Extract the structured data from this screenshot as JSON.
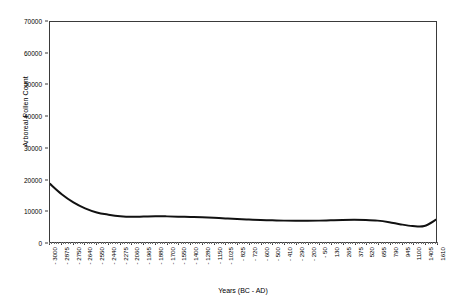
{
  "chart_data": {
    "type": "line",
    "title": "",
    "xlabel": "Years (BC - AD)",
    "ylabel": "Arboreal Pollen Count",
    "ylim": [
      0,
      70000
    ],
    "yticks": [
      0,
      10000,
      20000,
      30000,
      40000,
      50000,
      60000,
      70000
    ],
    "ytick_labels": [
      "0",
      "10000",
      "20000",
      "30000",
      "40000",
      "50000",
      "60000",
      "70000"
    ],
    "grid": false,
    "legend": "none",
    "categories": [
      "- 3000",
      "- 2875",
      "- 2750",
      "- 2640",
      "- 2550",
      "- 2440",
      "- 2275",
      "- 2060",
      "- 1965",
      "- 1880",
      "- 1700",
      "- 1550",
      "- 1400",
      "- 1280",
      "- 1150",
      "- 1025",
      "- 825",
      "- 720",
      "- 600",
      "- 500",
      "- 410",
      "- 290",
      "- 200",
      "- 50",
      "130",
      "265",
      "375",
      "520",
      "655",
      "790",
      "945",
      "1100",
      "1405",
      "1610"
    ],
    "values": [
      18500,
      15200,
      12600,
      10700,
      9400,
      8700,
      8200,
      8000,
      8100,
      8200,
      8150,
      8050,
      7950,
      7850,
      7700,
      7500,
      7300,
      7150,
      7000,
      6900,
      6800,
      6750,
      6750,
      6800,
      6900,
      7000,
      7050,
      7000,
      6800,
      6300,
      5600,
      5100,
      5100,
      7100
    ],
    "series_name": "Arboreal Pollen Count",
    "line_color": "#111111",
    "line_width": 2.0,
    "axis_color": "#3a3a3a",
    "background": "#ffffff"
  }
}
